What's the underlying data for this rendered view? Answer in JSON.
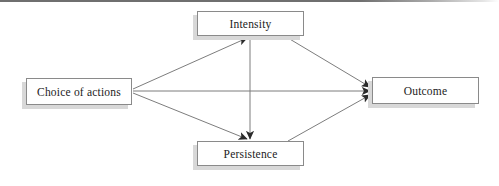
{
  "figure": {
    "type": "flow-diagram",
    "title": "",
    "background_color": "#ffffff",
    "top_rule_color": "#6f6f6f",
    "node_border_color": "#8a8a8a",
    "node_shadow_color": "#d8d8d8",
    "edge_color": "#7d7d7d",
    "arrowhead_color": "#2b2b2b"
  },
  "nodes": {
    "choice": {
      "id": "choice",
      "label": "Choice of actions"
    },
    "intensity": {
      "id": "intensity",
      "label": "Intensity"
    },
    "persistence": {
      "id": "persistence",
      "label": "Persistence"
    },
    "outcome": {
      "id": "outcome",
      "label": "Outcome"
    }
  },
  "edges": [
    {
      "id": "choice-to-intensity",
      "from": "Choice of actions",
      "to": "Intensity",
      "label": "",
      "arrow": "single"
    },
    {
      "id": "choice-to-outcome",
      "from": "Choice of actions",
      "to": "Outcome",
      "label": "",
      "arrow": "single"
    },
    {
      "id": "choice-to-persistence",
      "from": "Choice of actions",
      "to": "Persistence",
      "label": "",
      "arrow": "single"
    },
    {
      "id": "intensity-to-outcome",
      "from": "Intensity",
      "to": "Outcome",
      "label": "",
      "arrow": "single"
    },
    {
      "id": "intensity-to-persistence",
      "from": "Intensity",
      "to": "Persistence",
      "label": "",
      "arrow": "single"
    },
    {
      "id": "persistence-to-outcome",
      "from": "Persistence",
      "to": "Outcome",
      "label": "",
      "arrow": "single"
    }
  ]
}
